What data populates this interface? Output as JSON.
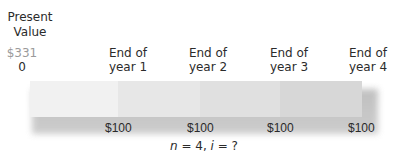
{
  "present_value": {
    "title_line1": "Present",
    "title_line2": "Value",
    "amount": "$331",
    "time_label": "0"
  },
  "timeline": {
    "headers": [
      {
        "line1": "End of",
        "line2": "year 1"
      },
      {
        "line1": "End of",
        "line2": "year 2"
      },
      {
        "line1": "End of",
        "line2": "year 3"
      },
      {
        "line1": "End of",
        "line2": "year 4"
      }
    ],
    "cash_flows": [
      "$100",
      "$100",
      "$100",
      "$100"
    ],
    "segment_colors": [
      "#f1f1f1",
      "#e7e7e7",
      "#e0e0e0",
      "#d7d7d7"
    ],
    "shadow_color": "#bdbdbd"
  },
  "formula": {
    "n_var": "n",
    "n_text": " = 4, ",
    "i_var": "i",
    "i_text": " = ?"
  },
  "colors": {
    "pv_amount": "#9a9a9a",
    "text": "#2b2b2b"
  }
}
